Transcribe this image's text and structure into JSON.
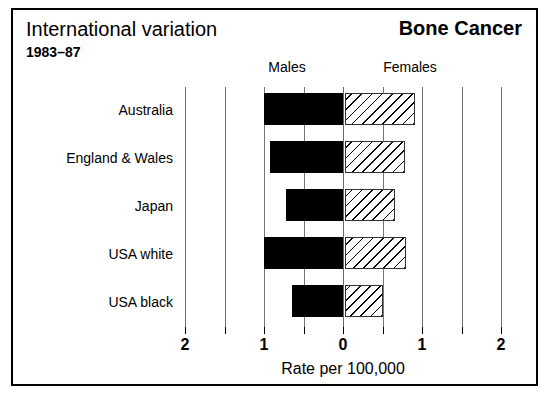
{
  "header": {
    "title": "International variation",
    "period": "1983–87",
    "topic": "Bone Cancer"
  },
  "sex_headers": {
    "males": "Males",
    "females": "Females"
  },
  "chart_data": {
    "type": "bar",
    "orientation": "horizontal",
    "style": "bidirectional-pyramid",
    "title": "International variation",
    "subtitle": "1983–87",
    "topic": "Bone Cancer",
    "xlabel": "Rate per 100,000",
    "ylabel": "",
    "categories": [
      "Australia",
      "England & Wales",
      "Japan",
      "USA white",
      "USA black"
    ],
    "series": [
      {
        "name": "Males",
        "direction": "left",
        "fill": "solid-black",
        "values": [
          1.0,
          0.92,
          0.72,
          1.0,
          0.65
        ]
      },
      {
        "name": "Females",
        "direction": "right",
        "fill": "diagonal-hatch",
        "values": [
          0.88,
          0.76,
          0.63,
          0.77,
          0.48
        ]
      }
    ],
    "x_axis": {
      "left_max": 2,
      "right_max": 2,
      "tick_labels": [
        "2",
        "1",
        "0",
        "1",
        "2"
      ],
      "tick_values": [
        -2,
        -1,
        0,
        1,
        2
      ],
      "minor_tick_values": [
        -1.5,
        -0.5,
        0.5,
        1.5
      ],
      "units": "Rate per 100,000"
    },
    "grid": true,
    "legend": "none"
  },
  "axis": {
    "caption": "Rate per 100,000",
    "ticks": [
      {
        "label": "2",
        "value": -2
      },
      {
        "label": "",
        "value": -1.5
      },
      {
        "label": "1",
        "value": -1
      },
      {
        "label": "",
        "value": -0.5
      },
      {
        "label": "0",
        "value": 0
      },
      {
        "label": "",
        "value": 0.5
      },
      {
        "label": "1",
        "value": 1
      },
      {
        "label": "",
        "value": 1.5
      },
      {
        "label": "2",
        "value": 2
      }
    ]
  },
  "colors": {
    "male_bar": "#000000",
    "female_bar_outline": "#333333",
    "gridline": "#767676",
    "frame": "#000000",
    "background": "#ffffff"
  }
}
